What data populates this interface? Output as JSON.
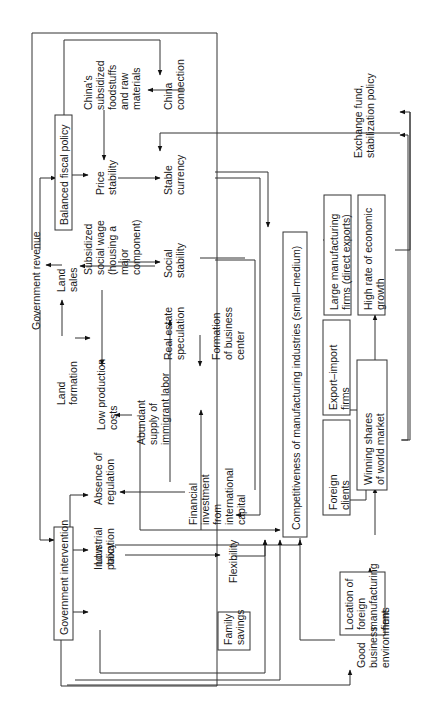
{
  "diagram": {
    "orientation": "rotated-90-ccw",
    "nodes": {
      "government_intervention": "Government intervention",
      "balanced_fiscal_policy": "Balanced fiscal policy",
      "government_revenue": "Government revenue",
      "industrial_policy": [
        "Industrial",
        "policy"
      ],
      "absence_of_regulation": [
        "Absence of",
        "regulation"
      ],
      "low_taxation": [
        "Low",
        "taxation"
      ],
      "land_formation": [
        "Land",
        "formation"
      ],
      "land_sales": [
        "Land",
        "sales"
      ],
      "low_production_costs": [
        "Low production",
        "costs"
      ],
      "abundant_labor": [
        "Abundant",
        "supply of",
        "immigrant labor"
      ],
      "subsidized_social_wage": [
        "Subsidized",
        "social wage",
        "(housing a",
        "major",
        "component)"
      ],
      "price_stability": [
        "Price",
        "stability"
      ],
      "chinas_subsidized": [
        "China's",
        "subsidized",
        "foodstuffs",
        "and raw",
        "materials"
      ],
      "china_connection": [
        "China",
        "connection"
      ],
      "stable_currency": [
        "Stable",
        "currency"
      ],
      "social_stability": [
        "Social",
        "stability"
      ],
      "real_estate_speculation": [
        "Real estate",
        "speculation"
      ],
      "formation_business_center": [
        "Formation",
        "of business",
        "center"
      ],
      "financial_investment": [
        "Financial",
        "investment",
        "from",
        "international",
        "capital"
      ],
      "flexibility": "Flexibility",
      "family_savings": [
        "Family",
        "savings"
      ],
      "competitiveness": "Competitiveness of manufacturing industries (small–medium)",
      "foreign_clients": [
        "Foreign",
        "clients"
      ],
      "export_import_firms": [
        "Export–import",
        "firms"
      ],
      "large_manufacturing_firms": [
        "Large manufacturing",
        "firms (direct exports)"
      ],
      "winning_shares": [
        "Winning shares",
        "of world market"
      ],
      "high_rate_growth": [
        "High rate of economic",
        "growth"
      ],
      "location_foreign_firms": [
        "Location of",
        "foreign",
        "manufacturing",
        "firms"
      ],
      "good_business_environment": [
        "Good",
        "business",
        "environment"
      ],
      "exchange_fund": [
        "Exchange fund,",
        "stabilization policy"
      ]
    },
    "colors": {
      "line": "#333333",
      "background": "#ffffff",
      "text": "#1a1a1a"
    }
  }
}
